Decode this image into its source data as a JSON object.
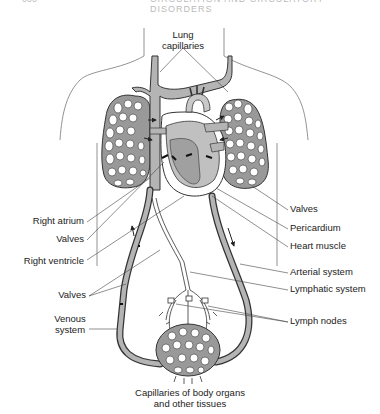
{
  "header": {
    "page_number": "000",
    "running_title": "CIRCULATION AND CIRCULATORY DISORDERS"
  },
  "diagram": {
    "colors": {
      "vessel_fill": "#b4b4b4",
      "heart_fill": "#c8c8c8",
      "heart_dark": "#a8a8a8",
      "outline": "#333333",
      "body_outline": "#777777"
    },
    "labels": {
      "lung_capillaries_1": "Lung",
      "lung_capillaries_2": "capillaries",
      "right_atrium": "Right atrium",
      "valves_left_upper": "Valves",
      "right_ventricle": "Right ventricle",
      "valves_left_lower": "Valves",
      "venous_system_1": "Venous",
      "venous_system_2": "system",
      "valves_right": "Valves",
      "pericardium": "Pericardium",
      "heart_muscle": "Heart muscle",
      "arterial_system": "Arterial system",
      "lymphatic_system": "Lymphatic system",
      "lymph_nodes": "Lymph nodes",
      "body_capillaries_1": "Capillaries of body organs",
      "body_capillaries_2": "and other tissues"
    }
  }
}
